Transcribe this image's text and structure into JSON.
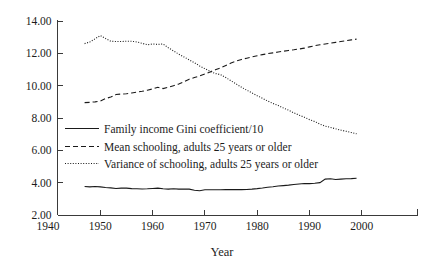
{
  "chart_data": {
    "type": "line",
    "title": "",
    "xlabel": "Year",
    "ylabel": "",
    "xlim": [
      1940,
      2005
    ],
    "ylim": [
      2.0,
      14.0
    ],
    "grid": false,
    "legend_position": "inside-center-left",
    "xticks": [
      "1940",
      "1950",
      "1960",
      "1970",
      "1980",
      "1990",
      "2000"
    ],
    "xtick_values": [
      1940,
      1950,
      1960,
      1970,
      1980,
      1990,
      2000
    ],
    "yticks": [
      "2.00",
      "4.00",
      "6.00",
      "8.00",
      "10.00",
      "12.00",
      "14.00"
    ],
    "ytick_values": [
      2.0,
      4.0,
      6.0,
      8.0,
      10.0,
      12.0,
      14.0
    ],
    "x": [
      1947,
      1948,
      1949,
      1950,
      1951,
      1952,
      1953,
      1954,
      1955,
      1956,
      1957,
      1958,
      1959,
      1960,
      1961,
      1962,
      1963,
      1964,
      1965,
      1966,
      1967,
      1968,
      1969,
      1970,
      1971,
      1972,
      1973,
      1974,
      1975,
      1976,
      1977,
      1978,
      1979,
      1980,
      1981,
      1982,
      1983,
      1984,
      1985,
      1986,
      1987,
      1988,
      1989,
      1990,
      1991,
      1992,
      1993,
      1994,
      1995,
      1996,
      1997,
      1998,
      1999
    ],
    "series": [
      {
        "name": "Family income Gini coefficient/10",
        "style": "solid",
        "values": [
          3.76,
          3.74,
          3.76,
          3.74,
          3.7,
          3.68,
          3.64,
          3.66,
          3.66,
          3.63,
          3.62,
          3.61,
          3.62,
          3.64,
          3.66,
          3.62,
          3.6,
          3.62,
          3.6,
          3.6,
          3.6,
          3.53,
          3.5,
          3.56,
          3.56,
          3.56,
          3.56,
          3.57,
          3.57,
          3.57,
          3.57,
          3.58,
          3.6,
          3.63,
          3.67,
          3.72,
          3.75,
          3.79,
          3.82,
          3.85,
          3.89,
          3.92,
          3.95,
          3.94,
          3.96,
          4.0,
          4.22,
          4.24,
          4.2,
          4.22,
          4.24,
          4.25,
          4.27
        ]
      },
      {
        "name": "Mean schooling, adults 25 years or older",
        "style": "dashed",
        "values": [
          8.95,
          8.97,
          9.0,
          9.05,
          9.2,
          9.3,
          9.45,
          9.48,
          9.5,
          9.55,
          9.6,
          9.65,
          9.72,
          9.8,
          9.9,
          9.82,
          9.9,
          10.0,
          10.1,
          10.25,
          10.4,
          10.5,
          10.6,
          10.72,
          10.85,
          10.98,
          11.1,
          11.25,
          11.4,
          11.52,
          11.62,
          11.7,
          11.78,
          11.85,
          11.92,
          11.98,
          12.03,
          12.08,
          12.13,
          12.18,
          12.22,
          12.27,
          12.32,
          12.4,
          12.47,
          12.53,
          12.58,
          12.63,
          12.68,
          12.73,
          12.78,
          12.83,
          12.88
        ]
      },
      {
        "name": "Variance of schooling, adults 25 years or older",
        "style": "dotted",
        "values": [
          12.6,
          12.7,
          12.9,
          13.1,
          12.92,
          12.75,
          12.73,
          12.73,
          12.75,
          12.75,
          12.7,
          12.62,
          12.53,
          12.58,
          12.55,
          12.58,
          12.35,
          12.15,
          11.95,
          11.78,
          11.6,
          11.42,
          11.22,
          11.05,
          10.88,
          10.75,
          10.68,
          10.5,
          10.3,
          10.1,
          9.9,
          9.72,
          9.55,
          9.38,
          9.22,
          9.05,
          8.9,
          8.78,
          8.62,
          8.48,
          8.32,
          8.18,
          8.05,
          7.9,
          7.78,
          7.62,
          7.5,
          7.42,
          7.33,
          7.25,
          7.18,
          7.1,
          7.02
        ]
      }
    ]
  },
  "legend": {
    "items": [
      {
        "label": "Family income Gini coefficient/10",
        "style": "solid"
      },
      {
        "label": "Mean schooling, adults 25 years or older",
        "style": "dashed"
      },
      {
        "label": "Variance of schooling, adults 25 years or older",
        "style": "dotted"
      }
    ]
  },
  "colors": {
    "axis": "#3a3a3a",
    "series": "#1a1a1a",
    "background": "#ffffff",
    "text": "#1c1c1c"
  }
}
